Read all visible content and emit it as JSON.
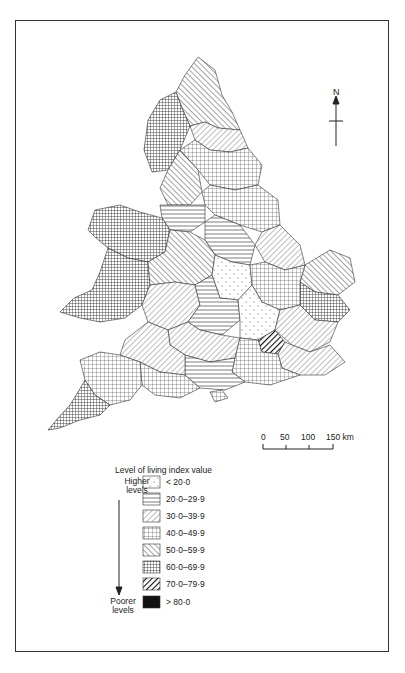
{
  "map": {
    "subject": "England and Wales",
    "north_label": "N",
    "scale": {
      "ticks": [
        "0",
        "50",
        "100",
        "150 km"
      ]
    },
    "legend": {
      "title": "Level of living index value",
      "top_label": "Higher levels",
      "bottom_label": "Poorer levels",
      "items": [
        {
          "label": "< 20·0",
          "pattern": "sparse-dots"
        },
        {
          "label": "20·0–29·9",
          "pattern": "horizontal-lines"
        },
        {
          "label": "30·0–39·9",
          "pattern": "diagonal-backslash"
        },
        {
          "label": "40·0–49·9",
          "pattern": "open-grid"
        },
        {
          "label": "50·0–59·9",
          "pattern": "diagonal-slash"
        },
        {
          "label": "60·0–69·9",
          "pattern": "dense-grid"
        },
        {
          "label": "70·0–79·9",
          "pattern": "heavy-diagonal"
        },
        {
          "label": "> 80·0",
          "pattern": "solid-black"
        }
      ]
    }
  }
}
